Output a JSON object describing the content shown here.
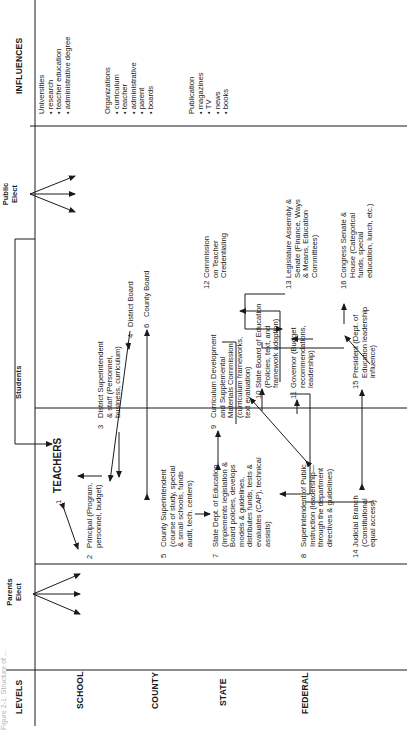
{
  "figure": {
    "caption_fragment": "Figure 2-1: Structure of ..."
  },
  "columns": {
    "levels_header": "LEVELS",
    "parents_elect": [
      "Parents",
      "Elect"
    ],
    "students_header": "Students",
    "public_elect": [
      "Public",
      "Elect"
    ],
    "influences_header": "INFLUENCES"
  },
  "levels": [
    {
      "id": "school",
      "label": "SCHOOL"
    },
    {
      "id": "county",
      "label": "COUNTY"
    },
    {
      "id": "state",
      "label": "STATE"
    },
    {
      "id": "federal",
      "label": "FEDERAL"
    }
  ],
  "nodes": {
    "n1": {
      "num": "1",
      "lines": [
        "TEACHERS"
      ]
    },
    "n2": {
      "num": "2",
      "lines": [
        "Principal (Program,",
        "personnel, budget)"
      ]
    },
    "n3": {
      "num": "3",
      "lines": [
        "District Superintendent",
        "& staff (Personnel,",
        "business, curriculum)"
      ]
    },
    "n4": {
      "num": "4",
      "lines": [
        "District Board"
      ]
    },
    "n5": {
      "num": "5",
      "lines": [
        "County Superintendent",
        "(course of study, special",
        "& small schools, funds",
        "audit, tech. centers)"
      ]
    },
    "n6": {
      "num": "6",
      "lines": [
        "County Board"
      ]
    },
    "n7": {
      "num": "7",
      "lines": [
        "State Dept. of Education",
        "(Implements legislation &",
        "Board policies, develops",
        "models & guidelines,",
        "distributes funds, tests &",
        "evaluates (CAP), technical",
        "assists)"
      ]
    },
    "n8": {
      "num": "8",
      "lines": [
        "Superintendent of Public",
        "Instruction (leadership—",
        "through the department",
        "directives & guidelines)"
      ]
    },
    "n9": {
      "num": "9",
      "lines": [
        "Curriculum Development",
        "and Supplemental",
        "Materials Commission",
        "(curriculum frameworks,",
        "text evaluation)"
      ]
    },
    "n10": {
      "num": "10",
      "lines": [
        "State Board of Education",
        "(Policies, text, and",
        "framework adoption)"
      ]
    },
    "n11": {
      "num": "11",
      "lines": [
        "Governor (Budget",
        "recommendations,",
        "leadership)"
      ]
    },
    "n12": {
      "num": "12",
      "lines": [
        "Commission",
        "on Teacher",
        "Credentialing"
      ]
    },
    "n13": {
      "num": "13",
      "lines": [
        "Legislature Assembly &",
        "Senate (Finance, Ways",
        "& Means, Education",
        "Committees)"
      ]
    },
    "n14": {
      "num": "14",
      "lines": [
        "Judicial Branch",
        "(Constitutional",
        "equal access)"
      ]
    },
    "n15": {
      "num": "15",
      "lines": [
        "President (Dept. of",
        "Education leadership",
        "influence)"
      ]
    },
    "n16": {
      "num": "16",
      "lines": [
        "Congress Senate &",
        "House (Categorical",
        "funds, special",
        "education, lunch, etc.)"
      ]
    }
  },
  "influences": [
    {
      "title": "Universities",
      "items": [
        "research",
        "teacher education",
        "administrative degree"
      ]
    },
    {
      "title": "Organizations",
      "items": [
        "curriculum",
        "teacher",
        "administrative",
        "parent",
        "boards"
      ]
    },
    {
      "title": "Publication",
      "items": [
        "magazines",
        "TV",
        "news",
        "books"
      ]
    }
  ],
  "style": {
    "ink": "#1a1a1a",
    "paper": "#ffffff"
  }
}
